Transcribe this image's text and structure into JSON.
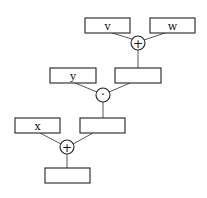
{
  "diagram": {
    "type": "computation-tree",
    "boxes": [
      {
        "id": "v",
        "label": "v",
        "x": 85,
        "y": 18,
        "w": 45,
        "h": 15
      },
      {
        "id": "w",
        "label": "w",
        "x": 150,
        "y": 18,
        "w": 45,
        "h": 15
      },
      {
        "id": "y",
        "label": "y",
        "x": 50,
        "y": 68,
        "w": 46,
        "h": 15
      },
      {
        "id": "vw_sum",
        "label": "",
        "x": 115,
        "y": 68,
        "w": 46,
        "h": 15
      },
      {
        "id": "x",
        "label": "x",
        "x": 15,
        "y": 118,
        "w": 45,
        "h": 15
      },
      {
        "id": "prod",
        "label": "",
        "x": 80,
        "y": 118,
        "w": 45,
        "h": 15
      },
      {
        "id": "result",
        "label": "",
        "x": 45,
        "y": 168,
        "w": 45,
        "h": 15
      }
    ],
    "operators": [
      {
        "id": "plus1",
        "symbol": "+",
        "cx": 138,
        "cy": 43,
        "r": 7
      },
      {
        "id": "dot",
        "symbol": "·",
        "cx": 103,
        "cy": 95,
        "r": 7
      },
      {
        "id": "plus2",
        "symbol": "+",
        "cx": 67,
        "cy": 147,
        "r": 7
      }
    ]
  }
}
